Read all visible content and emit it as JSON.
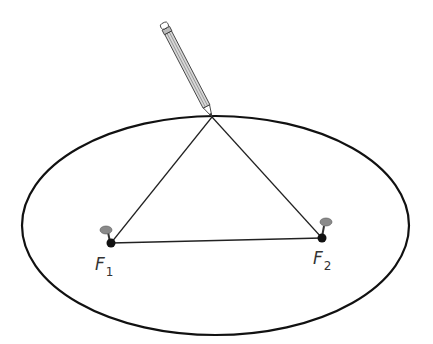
{
  "diagram": {
    "foci": [
      {
        "id": "F1",
        "label": "F",
        "subscript": "1",
        "x": 111,
        "y": 243
      },
      {
        "id": "F2",
        "label": "F",
        "subscript": "2",
        "x": 322,
        "y": 238
      }
    ],
    "ellipse": {
      "cx": 215.5,
      "cy": 225.5,
      "rx": 193.5,
      "ry": 109.5
    },
    "pencil_tip": {
      "x": 212,
      "y": 117
    },
    "colors": {
      "stroke": "#111111",
      "pin_head": "#8a8a8a",
      "focus_dot": "#111111"
    }
  }
}
